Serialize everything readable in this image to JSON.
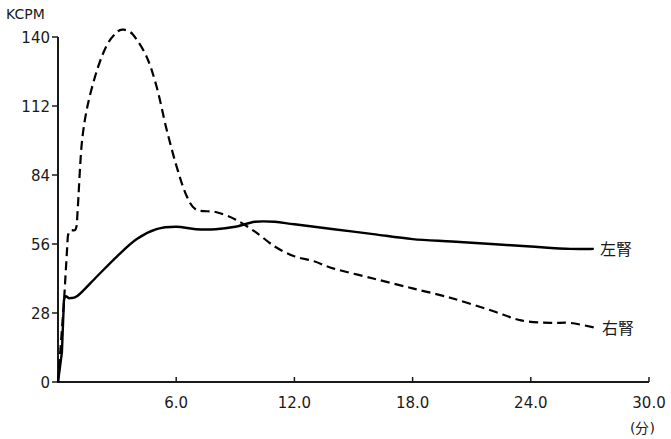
{
  "chart_data": {
    "type": "line",
    "title": "",
    "ylabel": "KCPM",
    "xlabel": "(分)",
    "xlim": [
      0,
      30
    ],
    "ylim": [
      0,
      140
    ],
    "grid": false,
    "x_ticks": [
      {
        "value": 6,
        "label": "6.0"
      },
      {
        "value": 12,
        "label": "12.0"
      },
      {
        "value": 18,
        "label": "18.0"
      },
      {
        "value": 24,
        "label": "24.0"
      },
      {
        "value": 30,
        "label": "30.0"
      }
    ],
    "y_ticks": [
      {
        "value": 0,
        "label": "0"
      },
      {
        "value": 28,
        "label": "28"
      },
      {
        "value": 56,
        "label": "56"
      },
      {
        "value": 84,
        "label": "84"
      },
      {
        "value": 112,
        "label": "112"
      },
      {
        "value": 140,
        "label": "140"
      }
    ],
    "series": [
      {
        "name": "左腎",
        "style": "solid",
        "color": "#000000",
        "x": [
          0,
          0.2,
          0.3,
          0.6,
          1,
          2,
          3,
          4,
          5,
          6,
          7,
          8,
          9,
          10,
          11,
          12,
          14,
          16,
          18,
          20,
          22,
          24,
          26,
          27.2
        ],
        "y": [
          0,
          12,
          33,
          34,
          35,
          43,
          51,
          58,
          62,
          63,
          62,
          62,
          63,
          65,
          65,
          64,
          62,
          60,
          58,
          57,
          56,
          55,
          54,
          54
        ]
      },
      {
        "name": "右腎",
        "style": "dashed",
        "color": "#000000",
        "x": [
          0,
          0.3,
          0.5,
          0.9,
          1.0,
          1.2,
          1.5,
          2,
          2.5,
          3,
          3.3,
          3.8,
          4.5,
          5,
          5.5,
          6,
          6.5,
          7,
          8,
          9,
          10,
          11,
          12,
          13,
          14,
          16,
          18,
          20,
          22,
          23.5,
          25,
          26,
          27.3
        ],
        "y": [
          0,
          32,
          59,
          62,
          70,
          96,
          112,
          127,
          137,
          142,
          143,
          141,
          132,
          120,
          103,
          88,
          76,
          70,
          69,
          66,
          61,
          55,
          51,
          49,
          46,
          42,
          38,
          34,
          29,
          25,
          24,
          24,
          22
        ]
      }
    ]
  }
}
